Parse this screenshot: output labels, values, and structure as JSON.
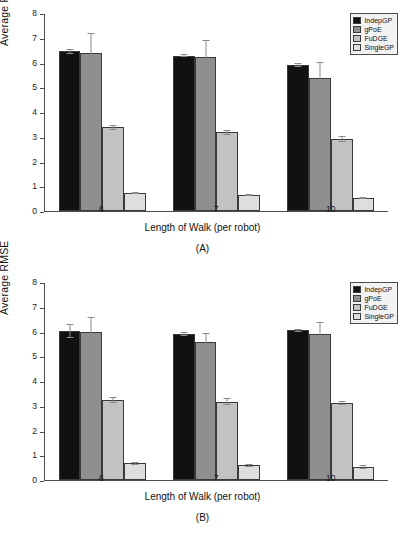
{
  "chart_data": [
    {
      "type": "bar",
      "panel": "(A)",
      "title": "",
      "xlabel": "Length of Walk (per robot)",
      "ylabel": "Average RMSE",
      "categories": [
        "6",
        "7",
        "10"
      ],
      "ylim": [
        0,
        8
      ],
      "yticks": [
        "0",
        "1",
        "2",
        "3",
        "4",
        "5",
        "6",
        "7",
        "8"
      ],
      "grid": false,
      "legend_position": "top-right",
      "series": [
        {
          "name": "IndepGP",
          "color": "#111111",
          "values": [
            6.45,
            6.28,
            5.9
          ],
          "errors": [
            0.1,
            0.07,
            0.07
          ]
        },
        {
          "name": "gPoE",
          "color": "#8f8f8f",
          "values": [
            6.4,
            6.22,
            5.38
          ],
          "errors": [
            0.8,
            0.7,
            0.65
          ]
        },
        {
          "name": "FuDGE",
          "color": "#c2c2c2",
          "values": [
            3.38,
            3.18,
            2.92
          ],
          "errors": [
            0.1,
            0.1,
            0.13
          ]
        },
        {
          "name": "SingleGP",
          "color": "#dedede",
          "values": [
            0.72,
            0.64,
            0.52
          ],
          "errors": [
            0.04,
            0.04,
            0.05
          ]
        }
      ]
    },
    {
      "type": "bar",
      "panel": "(B)",
      "title": "",
      "xlabel": "Length of Walk (per robot)",
      "ylabel": "Average RMSE",
      "categories": [
        "6",
        "7",
        "10"
      ],
      "ylim": [
        0,
        8
      ],
      "yticks": [
        "0",
        "1",
        "2",
        "3",
        "4",
        "5",
        "6",
        "7",
        "8"
      ],
      "grid": false,
      "legend_position": "top-right",
      "series": [
        {
          "name": "IndepGP",
          "color": "#111111",
          "values": [
            6.02,
            5.9,
            6.05
          ],
          "errors": [
            0.3,
            0.07,
            0.05
          ]
        },
        {
          "name": "gPoE",
          "color": "#8f8f8f",
          "values": [
            6.0,
            5.58,
            5.9
          ],
          "errors": [
            0.57,
            0.35,
            0.5
          ]
        },
        {
          "name": "FuDGE",
          "color": "#c2c2c2",
          "values": [
            3.24,
            3.17,
            3.12
          ],
          "errors": [
            0.12,
            0.13,
            0.09
          ]
        },
        {
          "name": "SingleGP",
          "color": "#dedede",
          "values": [
            0.67,
            0.59,
            0.52
          ],
          "errors": [
            0.07,
            0.07,
            0.07
          ]
        }
      ]
    }
  ]
}
